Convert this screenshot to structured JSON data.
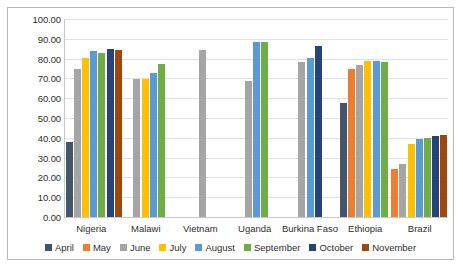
{
  "chart_data": {
    "type": "bar",
    "title": "",
    "xlabel": "",
    "ylabel": "",
    "ylim": [
      0,
      100
    ],
    "ytick_labels": [
      "100.00",
      "90.00",
      "80.00",
      "70.00",
      "60.00",
      "50.00",
      "40.00",
      "30.00",
      "20.00",
      "10.00",
      "0.00"
    ],
    "ytick_values": [
      100,
      90,
      80,
      70,
      60,
      50,
      40,
      30,
      20,
      10,
      0
    ],
    "grid": true,
    "legend_position": "bottom",
    "categories": [
      "Nigeria",
      "Malawi",
      "Vietnam",
      "Uganda",
      "Burkina Faso",
      "Ethiopia",
      "Brazil"
    ],
    "series": [
      {
        "name": "April",
        "color": "#44546A",
        "values": [
          38.0,
          null,
          null,
          null,
          null,
          57.5,
          null
        ]
      },
      {
        "name": "May",
        "color": "#ED7D31",
        "values": [
          null,
          null,
          null,
          null,
          null,
          75.0,
          24.5
        ]
      },
      {
        "name": "June",
        "color": "#A5A5A5",
        "values": [
          75.0,
          69.5,
          84.5,
          68.5,
          78.5,
          77.0,
          27.0
        ]
      },
      {
        "name": "July",
        "color": "#FFC000",
        "values": [
          80.5,
          69.5,
          null,
          null,
          null,
          79.0,
          37.0
        ]
      },
      {
        "name": "August",
        "color": "#5B9BD5",
        "values": [
          84.0,
          72.5,
          null,
          88.5,
          80.5,
          79.0,
          39.5
        ]
      },
      {
        "name": "September",
        "color": "#70AD47",
        "values": [
          83.0,
          77.5,
          null,
          88.5,
          null,
          78.5,
          40.0
        ]
      },
      {
        "name": "October",
        "color": "#264478",
        "values": [
          85.0,
          null,
          null,
          null,
          86.5,
          null,
          41.0
        ]
      },
      {
        "name": "November",
        "color": "#9E480E",
        "values": [
          84.5,
          null,
          null,
          null,
          null,
          null,
          41.5
        ]
      }
    ]
  },
  "legend": {
    "items": [
      {
        "label": "April",
        "color": "#44546A"
      },
      {
        "label": "May",
        "color": "#ED7D31"
      },
      {
        "label": "June",
        "color": "#A5A5A5"
      },
      {
        "label": "July",
        "color": "#FFC000"
      },
      {
        "label": "August",
        "color": "#5B9BD5"
      },
      {
        "label": "September",
        "color": "#70AD47"
      },
      {
        "label": "October",
        "color": "#264478"
      },
      {
        "label": "November",
        "color": "#9E480E"
      }
    ]
  },
  "colors": {
    "plot_background": "#ffffff",
    "gridline": "#e2e2e2",
    "axis_line": "#c9c9c9",
    "border": "#b8b8b8",
    "text": "#2f2f2f"
  }
}
